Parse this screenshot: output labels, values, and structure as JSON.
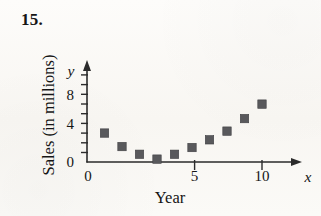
{
  "exercise": {
    "number": "15."
  },
  "chart_data": {
    "type": "scatter",
    "title": "",
    "xlabel": "Year",
    "ylabel": "Sales (in millions)",
    "x_axis_variable": "x",
    "y_axis_variable": "y",
    "xlim": [
      0,
      11.4
    ],
    "ylim": [
      0,
      10.4
    ],
    "xticks": [
      0,
      5,
      10
    ],
    "xtick_labels": [
      "0",
      "5",
      "10"
    ],
    "yticks": [
      0,
      4,
      8
    ],
    "ytick_labels": [
      "0",
      "4",
      "8"
    ],
    "y_minor_ticks": [
      2,
      6,
      10
    ],
    "grid": false,
    "legend": null,
    "marker_shape": "square",
    "marker_color": "#59595c",
    "axis_color": "#2b2b2b",
    "x": [
      1,
      2,
      3,
      4,
      5,
      6,
      7,
      8,
      9,
      10
    ],
    "values": [
      3.0,
      1.6,
      0.8,
      0.3,
      0.8,
      1.5,
      2.3,
      3.2,
      4.5,
      6.0
    ],
    "points": [
      {
        "x": 1,
        "y": 3.0
      },
      {
        "x": 2,
        "y": 1.6
      },
      {
        "x": 3,
        "y": 0.8
      },
      {
        "x": 4,
        "y": 0.3
      },
      {
        "x": 5,
        "y": 0.8
      },
      {
        "x": 6,
        "y": 1.5
      },
      {
        "x": 7,
        "y": 2.3
      },
      {
        "x": 8,
        "y": 3.2
      },
      {
        "x": 9,
        "y": 4.5
      },
      {
        "x": 10,
        "y": 6.0
      }
    ]
  }
}
